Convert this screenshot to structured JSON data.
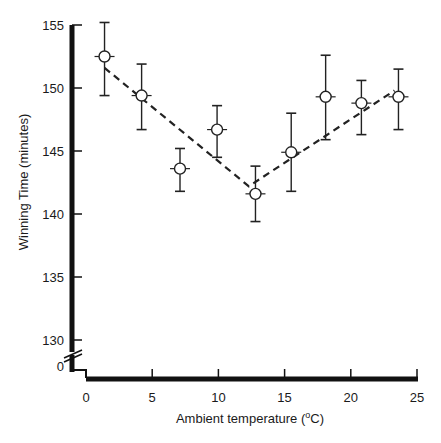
{
  "chart_data": {
    "type": "scatter",
    "title": "",
    "xlabel": "Ambient temperature (°C)",
    "xlabel_parts": {
      "prefix": "Ambient temperature (",
      "superscript": "o",
      "suffix": "C)"
    },
    "ylabel": "Winning Time (minutes)",
    "xlim": [
      0,
      25
    ],
    "ylim": [
      130,
      155
    ],
    "y_axis_break": true,
    "y_zero_label": "0",
    "x_ticks": [
      0,
      5,
      10,
      15,
      20,
      25
    ],
    "x_tick_labels": [
      "0",
      "5",
      "10",
      "15",
      "20",
      "25"
    ],
    "y_ticks": [
      130,
      135,
      140,
      145,
      150,
      155
    ],
    "y_tick_labels": [
      "130",
      "135",
      "140",
      "145",
      "150",
      "155"
    ],
    "grid": false,
    "legend": null,
    "series": [
      {
        "name": "Winning time",
        "marker": "open-circle",
        "x": [
          1.4,
          4.2,
          7.1,
          9.9,
          12.8,
          15.5,
          18.1,
          20.8,
          23.6
        ],
        "y": [
          152.5,
          149.4,
          143.6,
          146.7,
          141.6,
          144.9,
          149.3,
          148.8,
          149.3
        ],
        "err_upper": [
          155.2,
          151.9,
          145.2,
          148.6,
          143.8,
          148.0,
          152.6,
          150.6,
          151.5
        ],
        "err_lower": [
          149.4,
          146.7,
          141.8,
          144.5,
          139.4,
          141.8,
          145.9,
          146.3,
          146.7
        ]
      },
      {
        "name": "Fitted trend (piecewise linear)",
        "style": "dashed",
        "x": [
          1.4,
          12.3,
          23.3
        ],
        "y": [
          151.6,
          142.2,
          149.8
        ]
      }
    ]
  }
}
